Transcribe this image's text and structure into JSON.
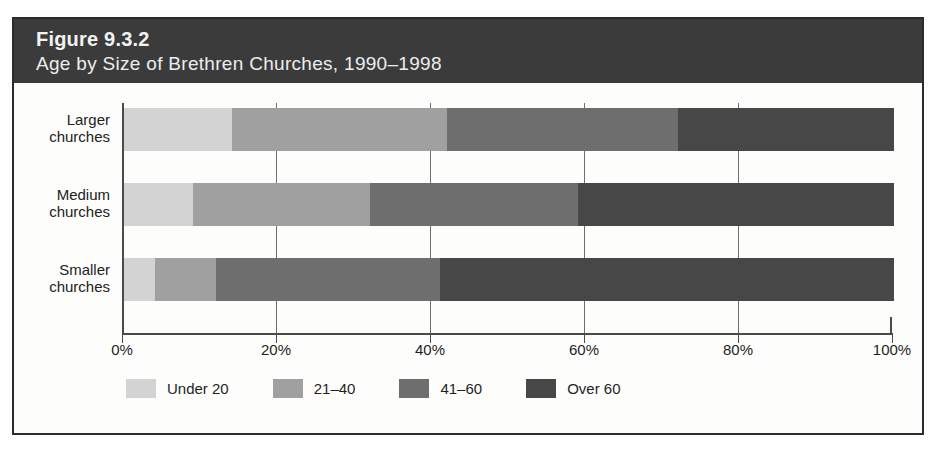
{
  "figure": {
    "number": "Figure 9.3.2",
    "subtitle": "Age by Size of Brethren Churches, 1990–1998"
  },
  "chart_data": {
    "type": "bar",
    "orientation": "horizontal",
    "stacked": true,
    "normalized": true,
    "title": "Figure 9.3.2",
    "subtitle": "Age by Size of Brethren Churches, 1990–1998",
    "xlabel": "",
    "ylabel": "",
    "xlim": [
      0,
      100
    ],
    "xticks": [
      0,
      20,
      40,
      60,
      80,
      100
    ],
    "xticklabels": [
      "0%",
      "20%",
      "40%",
      "60%",
      "80%",
      "100%"
    ],
    "grid": true,
    "legend_position": "bottom-left",
    "categories": [
      "Larger churches",
      "Medium churches",
      "Smaller churches"
    ],
    "category_lines": [
      [
        "Larger",
        "churches"
      ],
      [
        "Medium",
        "churches"
      ],
      [
        "Smaller",
        "churches"
      ]
    ],
    "series": [
      {
        "name": "Under 20",
        "color": "#d3d3d3",
        "values": [
          14,
          9,
          4
        ]
      },
      {
        "name": "21–40",
        "color": "#a0a0a0",
        "values": [
          28,
          23,
          8
        ]
      },
      {
        "name": "41–60",
        "color": "#6e6e6e",
        "values": [
          30,
          27,
          29
        ]
      },
      {
        "name": "Over 60",
        "color": "#474747",
        "values": [
          28,
          41,
          59
        ]
      }
    ],
    "cumulative_boundaries": {
      "Larger churches": [
        14,
        42,
        72,
        100
      ],
      "Medium churches": [
        9,
        32,
        59,
        100
      ],
      "Smaller churches": [
        4,
        12,
        41,
        100
      ]
    }
  },
  "legend": {
    "items": [
      {
        "label": "Under 20",
        "color": "#d3d3d3"
      },
      {
        "label": "21–40",
        "color": "#a0a0a0"
      },
      {
        "label": "41–60",
        "color": "#6e6e6e"
      },
      {
        "label": "Over 60",
        "color": "#474747"
      }
    ]
  },
  "axis": {
    "ticks": [
      {
        "label": "0%",
        "value": 0
      },
      {
        "label": "20%",
        "value": 20
      },
      {
        "label": "40%",
        "value": 40
      },
      {
        "label": "60%",
        "value": 60
      },
      {
        "label": "80%",
        "value": 80
      },
      {
        "label": "100%",
        "value": 100
      }
    ]
  },
  "colors": {
    "band_background": "#3b3b3b",
    "band_text": "#f2f2f2",
    "frame_border": "#2b2b2b",
    "plot_background": "#fdfdfc",
    "axis_line": "#4a4a4a"
  }
}
